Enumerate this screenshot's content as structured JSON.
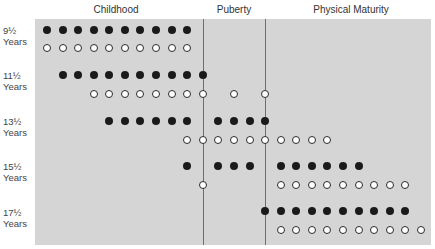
{
  "chart_data": {
    "type": "scatter",
    "title": "",
    "stages": [
      {
        "label": "Childhood",
        "center_x": 116
      },
      {
        "label": "Puberty",
        "center_x": 234
      },
      {
        "label": "Physical Maturity",
        "center_x": 351
      }
    ],
    "dividers_x": [
      203,
      265
    ],
    "grid": {
      "x0": 47,
      "step": 15.58
    },
    "rows": [
      {
        "label_line1": "9½",
        "label_line2": "Years",
        "filled_y": 30,
        "open_y": 48,
        "filled": [
          0,
          1,
          2,
          3,
          4,
          5,
          6,
          7,
          8,
          9
        ],
        "open": [
          0,
          1,
          2,
          3,
          4,
          5,
          6,
          7,
          8,
          9
        ]
      },
      {
        "label_line1": "11½",
        "label_line2": "Years",
        "filled_y": 75,
        "open_y": 94,
        "filled": [
          1,
          2,
          3,
          4,
          5,
          6,
          7,
          8,
          9,
          10
        ],
        "open": [
          3,
          4,
          5,
          6,
          7,
          8,
          9,
          10,
          12,
          14
        ]
      },
      {
        "label_line1": "13½",
        "label_line2": "Years",
        "filled_y": 121,
        "open_y": 140,
        "filled": [
          4,
          5,
          6,
          7,
          8,
          9,
          11,
          12,
          13,
          14
        ],
        "open": [
          9,
          10,
          11,
          12,
          13,
          14,
          15,
          16,
          17,
          18
        ]
      },
      {
        "label_line1": "15½",
        "label_line2": "Years",
        "filled_y": 166,
        "open_y": 185,
        "filled": [
          9,
          11,
          12,
          13,
          15,
          16,
          17,
          18,
          19,
          20
        ],
        "open": [
          10,
          15,
          16,
          17,
          18,
          19,
          20,
          21,
          22,
          23
        ]
      },
      {
        "label_line1": "17½",
        "label_line2": "Years",
        "filled_y": 211,
        "open_y": 230,
        "filled": [
          14,
          15,
          16,
          17,
          18,
          19,
          20,
          21,
          22,
          23
        ],
        "open": [
          15,
          16,
          17,
          18,
          19,
          20,
          21,
          22,
          23,
          24
        ]
      }
    ],
    "legend": [],
    "colors": {
      "panel": "#d5d5d5",
      "filled": "#1a1a1a",
      "open_fill": "#ffffff",
      "divider": "#6e6e6e"
    }
  },
  "header": {
    "childhood": "Childhood",
    "puberty": "Puberty",
    "physical_maturity": "Physical Maturity"
  },
  "rows": [
    {
      "age": "9½",
      "unit": "Years"
    },
    {
      "age": "11½",
      "unit": "Years"
    },
    {
      "age": "13½",
      "unit": "Years"
    },
    {
      "age": "15½",
      "unit": "Years"
    },
    {
      "age": "17½",
      "unit": "Years"
    }
  ]
}
